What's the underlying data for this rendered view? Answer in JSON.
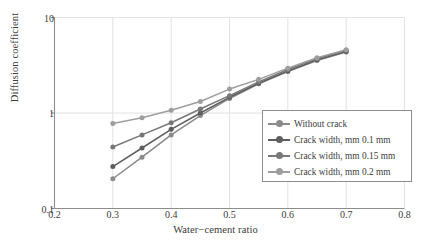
{
  "chart_data": {
    "type": "line",
    "title": "",
    "xlabel": "Water−cement ratio",
    "ylabel": "Diffusion coefficient",
    "xlim": [
      0.2,
      0.8
    ],
    "ylim": [
      0.1,
      10
    ],
    "yscale": "log",
    "xscale": "linear",
    "grid": true,
    "grid_axis": "both",
    "legend_position": "lower-right-inside",
    "xticks": [
      "0.2",
      "0.3",
      "0.4",
      "0.5",
      "0.6",
      "0.7",
      "0.8"
    ],
    "xtick_values": [
      0.2,
      0.3,
      0.4,
      0.5,
      0.6,
      0.7,
      0.8
    ],
    "yticks": [
      "0.1",
      "1",
      "10"
    ],
    "ytick_values": [
      0.1,
      1,
      10
    ],
    "x": [
      0.3,
      0.35,
      0.4,
      0.45,
      0.5,
      0.55,
      0.6,
      0.65,
      0.7
    ],
    "series": [
      {
        "name": "Without crack",
        "color": "#8a8a8a",
        "marker": "circle",
        "values": [
          0.205,
          0.345,
          0.59,
          0.94,
          1.42,
          2.02,
          2.72,
          3.55,
          4.35
        ]
      },
      {
        "name": "Crack width, mm 0.1 mm",
        "color": "#5e5e5e",
        "marker": "circle",
        "values": [
          0.275,
          0.43,
          0.675,
          1.0,
          1.46,
          2.05,
          2.75,
          3.6,
          4.4
        ]
      },
      {
        "name": "Crack width, mm 0.15 mm",
        "color": "#787878",
        "marker": "circle",
        "values": [
          0.44,
          0.59,
          0.79,
          1.1,
          1.52,
          2.12,
          2.85,
          3.7,
          4.55
        ]
      },
      {
        "name": "Crack width, mm 0.2 mm",
        "color": "#9e9e9e",
        "marker": "circle",
        "values": [
          0.775,
          0.89,
          1.07,
          1.32,
          1.78,
          2.25,
          2.95,
          3.8,
          4.6
        ]
      }
    ]
  },
  "legend": {
    "items": [
      {
        "label": "Without crack"
      },
      {
        "label": "Crack width, mm 0.1 mm"
      },
      {
        "label": "Crack width, mm 0.15 mm"
      },
      {
        "label": "Crack width, mm 0.2 mm"
      }
    ]
  },
  "colors": {
    "axis": "#8d8d8d",
    "grid": "#e2e2e2",
    "text": "#3b3b3b",
    "background": "#ffffff"
  }
}
